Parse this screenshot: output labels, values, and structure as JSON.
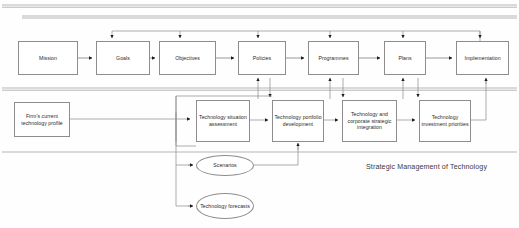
{
  "diagram": {
    "caption": "Strategic Management of Technology",
    "strategy_row": {
      "nodes": [
        {
          "id": "mission",
          "label": "Mission",
          "x": 18,
          "y": 41,
          "w": 60,
          "h": 34
        },
        {
          "id": "goals",
          "label": "Goals",
          "x": 96,
          "y": 41,
          "w": 54,
          "h": 34
        },
        {
          "id": "objectives",
          "label": "Objectives",
          "x": 159,
          "y": 41,
          "w": 57,
          "h": 34
        },
        {
          "id": "policies",
          "label": "Policies",
          "x": 238,
          "y": 41,
          "w": 48,
          "h": 34
        },
        {
          "id": "programmes",
          "label": "Programmes",
          "x": 308,
          "y": 41,
          "w": 51,
          "h": 34
        },
        {
          "id": "plans",
          "label": "Plans",
          "x": 384,
          "y": 41,
          "w": 42,
          "h": 34
        },
        {
          "id": "implementation",
          "label": "Implementation",
          "x": 456,
          "y": 41,
          "w": 53,
          "h": 34
        }
      ]
    },
    "technology_row": {
      "nodes": [
        {
          "id": "firm-profile",
          "label": "Firm's current technology profile",
          "x": 14,
          "y": 102,
          "w": 56,
          "h": 35
        },
        {
          "id": "situation-assessment",
          "label": "Technology situation assessment",
          "x": 196,
          "y": 100,
          "w": 54,
          "h": 42
        },
        {
          "id": "portfolio-development",
          "label": "Technology portfolio development",
          "x": 272,
          "y": 100,
          "w": 52,
          "h": 42
        },
        {
          "id": "strategic-integration",
          "label": "Technology and corporate strategic integration",
          "x": 342,
          "y": 100,
          "w": 55,
          "h": 42
        },
        {
          "id": "investment-priorities",
          "label": "Technology investment priorities",
          "x": 419,
          "y": 100,
          "w": 52,
          "h": 42
        }
      ],
      "ellipses": [
        {
          "id": "scenarios",
          "label": "Scenarios",
          "x": 196,
          "y": 155,
          "w": 58,
          "h": 21
        },
        {
          "id": "technology-forecasts",
          "label": "Technology forecasts",
          "x": 196,
          "y": 193,
          "w": 58,
          "h": 26
        }
      ]
    }
  }
}
